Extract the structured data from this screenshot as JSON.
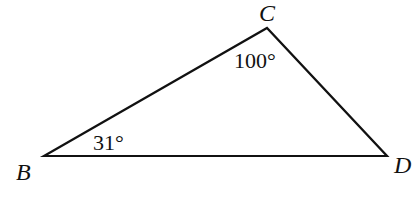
{
  "diagram": {
    "type": "triangle",
    "stroke_color": "#111111",
    "background": "#ffffff",
    "vertices": [
      {
        "name": "B",
        "label": "B",
        "x": 44,
        "y": 156,
        "label_x": 16,
        "label_y": 180
      },
      {
        "name": "C",
        "label": "C",
        "x": 267,
        "y": 28,
        "label_x": 259,
        "label_y": 21
      },
      {
        "name": "D",
        "label": "D",
        "x": 387,
        "y": 156,
        "label_x": 394,
        "label_y": 173
      }
    ],
    "edges": [
      {
        "from": "B",
        "to": "C"
      },
      {
        "from": "C",
        "to": "D"
      },
      {
        "from": "B",
        "to": "D"
      }
    ],
    "angles": [
      {
        "vertex": "C",
        "label": "100°",
        "x": 234,
        "y": 68
      },
      {
        "vertex": "B",
        "label": "31°",
        "x": 93,
        "y": 150
      }
    ]
  }
}
